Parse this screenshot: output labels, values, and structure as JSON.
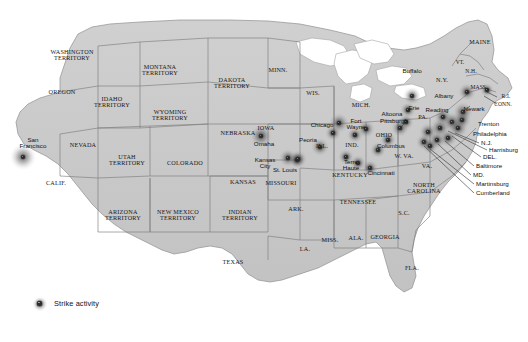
{
  "map": {
    "title": "Strike activity map of the United States",
    "colors": {
      "land": "#c9c9c9",
      "land_edge": "#9a9a9a",
      "border": "#6e6e6e",
      "water": "#ffffff",
      "lake_edge": "#a8a8a8",
      "text": "#171717",
      "marker": "#2b2b2b",
      "background": "#ffffff",
      "leader": "#303030"
    },
    "legend": {
      "icon": "strike-activity-marker-icon",
      "label": "Strike activity"
    },
    "states": [
      {
        "name": "WASHINGTON\nTERRITORY",
        "x": 72,
        "y": 55,
        "size": "sm"
      },
      {
        "name": "OREGON",
        "x": 62,
        "y": 92,
        "size": "sm"
      },
      {
        "name": "IDAHO\nTERRITORY",
        "x": 112,
        "y": 102,
        "size": "sm"
      },
      {
        "name": "MONTANA\nTERRITORY",
        "x": 160,
        "y": 70,
        "size": "sm"
      },
      {
        "name": "DAKOTA\nTERRITORY",
        "x": 232,
        "y": 83,
        "size": "sm"
      },
      {
        "name": "WYOMING\nTERRITORY",
        "x": 170,
        "y": 115,
        "size": "sm"
      },
      {
        "name": "NEVADA",
        "x": 83,
        "y": 145,
        "size": "sm"
      },
      {
        "name": "UTAH\nTERRITORY",
        "x": 127,
        "y": 160,
        "size": "sm"
      },
      {
        "name": "COLORADO",
        "x": 185,
        "y": 163,
        "size": "sm"
      },
      {
        "name": "NEBRASKA",
        "x": 238,
        "y": 133,
        "size": "sm"
      },
      {
        "name": "KANSAS",
        "x": 243,
        "y": 182,
        "size": "sm"
      },
      {
        "name": "CALIF.",
        "x": 56,
        "y": 183,
        "size": "sm"
      },
      {
        "name": "ARIZONA\nTERRITORY",
        "x": 123,
        "y": 215,
        "size": "sm"
      },
      {
        "name": "NEW MEXICO\nTERRITORY",
        "x": 178,
        "y": 215,
        "size": "sm"
      },
      {
        "name": "INDIAN\nTERRITORY",
        "x": 240,
        "y": 215,
        "size": "sm"
      },
      {
        "name": "TEXAS",
        "x": 233,
        "y": 262,
        "size": "sm"
      },
      {
        "name": "MINN.",
        "x": 278,
        "y": 70,
        "size": "sm"
      },
      {
        "name": "IOWA",
        "x": 266,
        "y": 128,
        "size": "sm"
      },
      {
        "name": "WIS.",
        "x": 313,
        "y": 93,
        "size": "sm"
      },
      {
        "name": "MICH.",
        "x": 361,
        "y": 105,
        "size": "sm"
      },
      {
        "name": "MISSOURI",
        "x": 281,
        "y": 183,
        "size": "sm"
      },
      {
        "name": "ILL.",
        "x": 322,
        "y": 146,
        "size": "sm"
      },
      {
        "name": "IND.",
        "x": 352,
        "y": 145,
        "size": "sm"
      },
      {
        "name": "OHIO",
        "x": 384,
        "y": 135,
        "size": "sm"
      },
      {
        "name": "KENTUCKY",
        "x": 350,
        "y": 175,
        "size": "sm"
      },
      {
        "name": "TENNESSEE",
        "x": 358,
        "y": 202,
        "size": "sm"
      },
      {
        "name": "ARK.",
        "x": 296,
        "y": 209,
        "size": "sm"
      },
      {
        "name": "LA.",
        "x": 305,
        "y": 249,
        "size": "sm"
      },
      {
        "name": "MISS.",
        "x": 330,
        "y": 240,
        "size": "sm"
      },
      {
        "name": "ALA.",
        "x": 356,
        "y": 238,
        "size": "sm"
      },
      {
        "name": "GEORGIA",
        "x": 385,
        "y": 237,
        "size": "sm"
      },
      {
        "name": "FLA.",
        "x": 412,
        "y": 268,
        "size": "sm"
      },
      {
        "name": "S.C.",
        "x": 404,
        "y": 213,
        "size": "sm"
      },
      {
        "name": "NORTH\nCAROLINA",
        "x": 424,
        "y": 188,
        "size": "sm"
      },
      {
        "name": "W. VA.",
        "x": 404,
        "y": 156,
        "size": "sm"
      },
      {
        "name": "VA.",
        "x": 427,
        "y": 166,
        "size": "sm"
      },
      {
        "name": "PA.",
        "x": 423,
        "y": 117,
        "size": "sm"
      },
      {
        "name": "N.Y.",
        "x": 442,
        "y": 80,
        "size": "sm"
      },
      {
        "name": "VT.",
        "x": 460,
        "y": 63,
        "size": "xs"
      },
      {
        "name": "N.H.",
        "x": 471,
        "y": 72,
        "size": "xs"
      },
      {
        "name": "MASS.",
        "x": 479,
        "y": 88,
        "size": "xs"
      },
      {
        "name": "MAINE",
        "x": 480,
        "y": 42,
        "size": "sm"
      },
      {
        "name": "R.I.",
        "x": 506,
        "y": 97,
        "size": "xs"
      },
      {
        "name": "CONN.",
        "x": 503,
        "y": 105,
        "size": "xs"
      }
    ],
    "cities": [
      {
        "name": "San\nFrancisco",
        "x": 33,
        "y": 143,
        "align": "center"
      },
      {
        "name": "Omaha",
        "x": 264,
        "y": 144,
        "align": "center"
      },
      {
        "name": "Kansas\nCity",
        "x": 265,
        "y": 163,
        "align": "center"
      },
      {
        "name": "St. Louis",
        "x": 285,
        "y": 170,
        "align": "center"
      },
      {
        "name": "Chicago",
        "x": 322,
        "y": 125,
        "align": "center"
      },
      {
        "name": "Peoria",
        "x": 308,
        "y": 140,
        "align": "center"
      },
      {
        "name": "Fort\nWayne",
        "x": 356,
        "y": 124,
        "align": "center"
      },
      {
        "name": "Terre\nHaute",
        "x": 351,
        "y": 165,
        "align": "center"
      },
      {
        "name": "Cincinnati",
        "x": 381,
        "y": 173,
        "align": "center"
      },
      {
        "name": "Columbus",
        "x": 391,
        "y": 146,
        "align": "center"
      },
      {
        "name": "Altoona",
        "x": 392,
        "y": 114,
        "align": "center"
      },
      {
        "name": "Pittsburgh",
        "x": 394,
        "y": 121,
        "align": "center"
      },
      {
        "name": "Erie",
        "x": 414,
        "y": 108,
        "align": "center"
      },
      {
        "name": "Buffalo",
        "x": 412,
        "y": 71,
        "align": "center"
      },
      {
        "name": "Albany",
        "x": 444,
        "y": 96,
        "align": "center"
      },
      {
        "name": "Reading",
        "x": 437,
        "y": 110,
        "align": "center"
      },
      {
        "name": "Newark",
        "x": 474,
        "y": 109,
        "align": "center"
      },
      {
        "name": "Trenton",
        "x": 478,
        "y": 124,
        "align": "left"
      },
      {
        "name": "Philadelphia",
        "x": 473,
        "y": 134,
        "align": "left"
      },
      {
        "name": "N.J.",
        "x": 481,
        "y": 143,
        "align": "left"
      },
      {
        "name": "Harrisburg",
        "x": 489,
        "y": 150,
        "align": "left"
      },
      {
        "name": "DEL.",
        "x": 483,
        "y": 157,
        "align": "left"
      },
      {
        "name": "Baltimore",
        "x": 476,
        "y": 166,
        "align": "left"
      },
      {
        "name": "MD.",
        "x": 473,
        "y": 175,
        "align": "left"
      },
      {
        "name": "Martinsburg",
        "x": 476,
        "y": 184,
        "align": "left"
      },
      {
        "name": "Cumberland",
        "x": 476,
        "y": 193,
        "align": "left"
      }
    ],
    "strike_markers": [
      {
        "city": "San Francisco",
        "x": 23,
        "y": 157,
        "r": 13
      },
      {
        "city": "Omaha",
        "x": 261,
        "y": 136,
        "r": 11
      },
      {
        "city": "Kansas City",
        "x": 288,
        "y": 158,
        "r": 9
      },
      {
        "city": "Kansas City east",
        "x": 297,
        "y": 160,
        "r": 8
      },
      {
        "city": "St. Louis",
        "x": 298,
        "y": 159,
        "r": 9
      },
      {
        "city": "Peoria",
        "x": 320,
        "y": 147,
        "r": 9
      },
      {
        "city": "Chicago",
        "x": 339,
        "y": 123,
        "r": 10
      },
      {
        "city": "Chicago south",
        "x": 333,
        "y": 133,
        "r": 8
      },
      {
        "city": "Fort Wayne",
        "x": 366,
        "y": 129,
        "r": 9
      },
      {
        "city": "Indiana north",
        "x": 355,
        "y": 135,
        "r": 8
      },
      {
        "city": "Terre Haute",
        "x": 346,
        "y": 157,
        "r": 8
      },
      {
        "city": "Indiana south",
        "x": 358,
        "y": 163,
        "r": 8
      },
      {
        "city": "Cincinnati",
        "x": 370,
        "y": 168,
        "r": 8
      },
      {
        "city": "Columbus",
        "x": 378,
        "y": 150,
        "r": 8
      },
      {
        "city": "Ohio east",
        "x": 388,
        "y": 140,
        "r": 8
      },
      {
        "city": "Altoona",
        "x": 406,
        "y": 122,
        "r": 8
      },
      {
        "city": "Pittsburgh",
        "x": 400,
        "y": 128,
        "r": 9
      },
      {
        "city": "Erie",
        "x": 408,
        "y": 110,
        "r": 8
      },
      {
        "city": "Buffalo",
        "x": 412,
        "y": 96,
        "r": 9
      },
      {
        "city": "Albany",
        "x": 467,
        "y": 92,
        "r": 9
      },
      {
        "city": "Reading",
        "x": 443,
        "y": 117,
        "r": 9
      },
      {
        "city": "Newark",
        "x": 463,
        "y": 112,
        "r": 10
      },
      {
        "city": "Penn east",
        "x": 452,
        "y": 122,
        "r": 10
      },
      {
        "city": "Penn mid",
        "x": 440,
        "y": 128,
        "r": 10
      },
      {
        "city": "Penn south",
        "x": 428,
        "y": 132,
        "r": 9
      },
      {
        "city": "Philadelphia",
        "x": 458,
        "y": 128,
        "r": 10
      },
      {
        "city": "Trenton",
        "x": 462,
        "y": 120,
        "r": 9
      },
      {
        "city": "Baltimore",
        "x": 448,
        "y": 138,
        "r": 9
      },
      {
        "city": "Maryland",
        "x": 437,
        "y": 140,
        "r": 9
      },
      {
        "city": "Cumberland",
        "x": 424,
        "y": 142,
        "r": 8
      },
      {
        "city": "Martinsburg",
        "x": 430,
        "y": 146,
        "r": 8
      },
      {
        "city": "Mass",
        "x": 487,
        "y": 90,
        "r": 7
      }
    ],
    "leader_lines": [
      {
        "from": "N.J.",
        "x1": 479,
        "y1": 143,
        "x2": 455,
        "y2": 133
      },
      {
        "from": "Harrisburg",
        "x1": 487,
        "y1": 150,
        "x2": 448,
        "y2": 131
      },
      {
        "from": "DEL.",
        "x1": 481,
        "y1": 157,
        "x2": 452,
        "y2": 136
      },
      {
        "from": "Baltimore",
        "x1": 474,
        "y1": 166,
        "x2": 445,
        "y2": 141
      },
      {
        "from": "MD.",
        "x1": 471,
        "y1": 175,
        "x2": 438,
        "y2": 144
      },
      {
        "from": "Martinsburg",
        "x1": 474,
        "y1": 184,
        "x2": 430,
        "y2": 149
      },
      {
        "from": "Cumberland",
        "x1": 474,
        "y1": 193,
        "x2": 424,
        "y2": 146
      },
      {
        "from": "R.I.",
        "x1": 497,
        "y1": 97,
        "x2": 487,
        "y2": 92
      },
      {
        "from": "CONN.",
        "x1": 497,
        "y1": 104,
        "x2": 484,
        "y2": 96
      },
      {
        "from": "Newark",
        "x1": 470,
        "y1": 106,
        "x2": 464,
        "y2": 111
      },
      {
        "from": "Pittsburgh",
        "x1": 405,
        "y1": 123,
        "x2": 401,
        "y2": 127
      }
    ]
  }
}
